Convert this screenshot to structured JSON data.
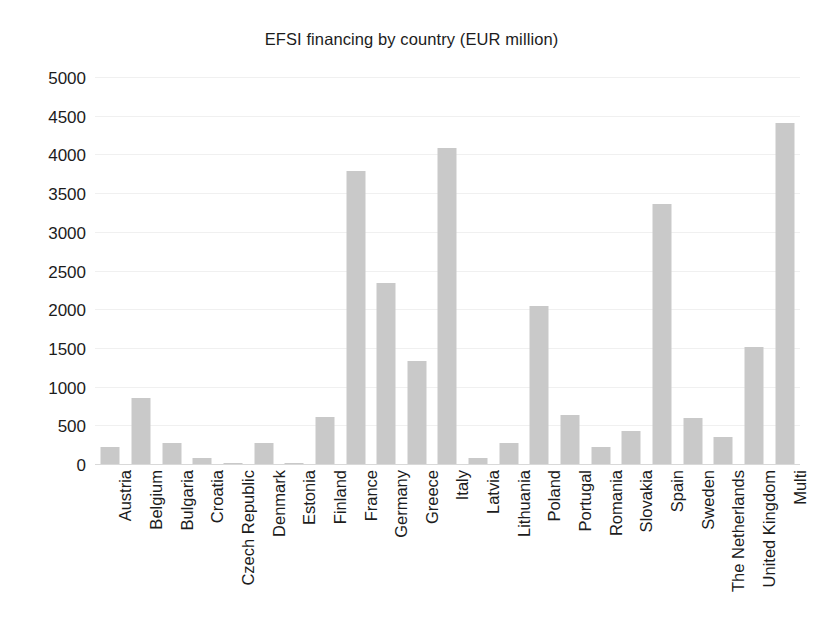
{
  "chart_data": {
    "type": "bar",
    "title": "EFSI financing by country (EUR million)",
    "xlabel": "",
    "ylabel": "",
    "ylim": [
      0,
      5000
    ],
    "ytick_step": 500,
    "yticks": [
      5000,
      4500,
      4000,
      3500,
      3000,
      2500,
      2000,
      1500,
      1000,
      500,
      0
    ],
    "ytick_labels": [
      "5000",
      "4500",
      "4000",
      "3500",
      "3000",
      "2500",
      "2000",
      "1500",
      "1000",
      "500",
      "0"
    ],
    "grid": true,
    "legend": false,
    "legend_position": "none",
    "bar_color": "#c9c9c9",
    "background_color": "#ffffff",
    "text_color": "#1c1c1c",
    "xtick_rotation": 90,
    "categories": [
      "Austria",
      "Belgium",
      "Bulgaria",
      "Croatia",
      "Czech Republic",
      "Denmark",
      "Estonia",
      "Finland",
      "France",
      "Germany",
      "Greece",
      "Italy",
      "Latvia",
      "Lithuania",
      "Poland",
      "Portugal",
      "Romania",
      "Slovakia",
      "Spain",
      "Sweden",
      "The Netherlands",
      "United Kingdom",
      "Multi"
    ],
    "values": [
      230,
      870,
      280,
      90,
      30,
      290,
      30,
      620,
      3800,
      2350,
      1340,
      4100,
      85,
      280,
      2060,
      640,
      230,
      440,
      3370,
      610,
      360,
      1520,
      4420
    ],
    "units": "EUR million"
  }
}
